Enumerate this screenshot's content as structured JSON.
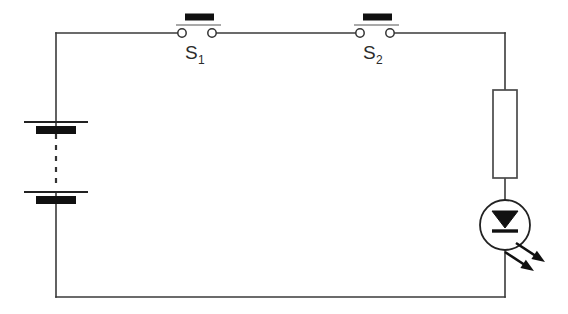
{
  "diagram": {
    "canvas": {
      "width": 568,
      "height": 314,
      "background": "#ffffff"
    },
    "colors": {
      "wire": "#3a3a3a",
      "symbol_fill": "#111111",
      "symbol_stroke": "#222222",
      "resistor_stroke": "#4a4a4a",
      "label_text": "#2b2b2b",
      "terminal_fill": "#ffffff"
    },
    "loop": {
      "left_x": 56,
      "right_x": 505,
      "top_y": 33,
      "bottom_y": 297
    }
  },
  "components": {
    "battery": {
      "name": "battery-stack",
      "icon": "battery-icon",
      "cells": [
        {
          "plate_y": 122,
          "plate_half_width": 32,
          "bar_y": 130,
          "bar_half_width": 20
        },
        {
          "plate_y": 192,
          "plate_half_width": 32,
          "bar_y": 200,
          "bar_half_width": 20
        }
      ],
      "dashed_link": {
        "x": 56,
        "y1": 134,
        "y2": 188
      },
      "center_x": 56
    },
    "switch_1": {
      "name": "switch-s1",
      "icon": "closed-switch-icon",
      "label_main": "S",
      "label_sub": "1",
      "label_x": 185,
      "label_y": 59,
      "terminal_left_x": 182,
      "terminal_right_x": 212,
      "terminal_y": 33,
      "terminal_r": 4.2,
      "blade_y": 17,
      "blade_x1": 185,
      "blade_x2": 214,
      "blade_height": 7,
      "blade_line_y": 25,
      "blade_line_x1": 176,
      "blade_line_x2": 221
    },
    "switch_2": {
      "name": "switch-s2",
      "icon": "closed-switch-icon",
      "label_main": "S",
      "label_sub": "2",
      "label_x": 363,
      "label_y": 59,
      "terminal_left_x": 360,
      "terminal_right_x": 390,
      "terminal_y": 33,
      "terminal_r": 4.2,
      "blade_y": 17,
      "blade_x1": 363,
      "blade_x2": 392,
      "blade_height": 7,
      "blade_line_y": 25,
      "blade_line_x1": 354,
      "blade_line_x2": 399
    },
    "resistor": {
      "name": "resistor",
      "icon": "resistor-icon",
      "x": 493,
      "y": 90,
      "width": 24,
      "height": 88
    },
    "led": {
      "name": "led",
      "icon": "led-icon",
      "center_x": 505,
      "center_y": 225,
      "radius": 25,
      "triangle": {
        "top_y": 211,
        "bottom_y": 228,
        "half_width": 13
      },
      "cathode_bar": {
        "y": 231,
        "half_width": 13
      },
      "rays": [
        {
          "x1": 516,
          "y1": 243,
          "x2": 545,
          "y2": 262
        },
        {
          "x1": 505,
          "y1": 252,
          "x2": 534,
          "y2": 271
        }
      ]
    }
  },
  "wires": {
    "top_left_segment": {
      "x1": 56,
      "y1": 33,
      "x2": 182,
      "y2": 33
    },
    "top_mid_segment": {
      "x1": 212,
      "y1": 33,
      "x2": 360,
      "y2": 33
    },
    "top_right_segment": {
      "x1": 390,
      "y1": 33,
      "x2": 505,
      "y2": 33
    },
    "left_upper_segment": {
      "x1": 56,
      "y1": 33,
      "x2": 56,
      "y2": 122
    },
    "left_mid_segment": {
      "x1": 56,
      "y1": 122,
      "x2": 56,
      "y2": 130
    },
    "left_lower_segment": {
      "x1": 56,
      "y1": 192,
      "x2": 56,
      "y2": 297
    },
    "bottom_segment": {
      "x1": 56,
      "y1": 297,
      "x2": 505,
      "y2": 297
    },
    "right_upper_segment": {
      "x1": 505,
      "y1": 33,
      "x2": 505,
      "y2": 90
    },
    "right_mid_segment": {
      "x1": 505,
      "y1": 178,
      "x2": 505,
      "y2": 200
    },
    "right_lower_segment": {
      "x1": 505,
      "y1": 250,
      "x2": 505,
      "y2": 297
    },
    "led_through_segment": {
      "x1": 505,
      "y1": 200,
      "x2": 505,
      "y2": 250
    }
  }
}
